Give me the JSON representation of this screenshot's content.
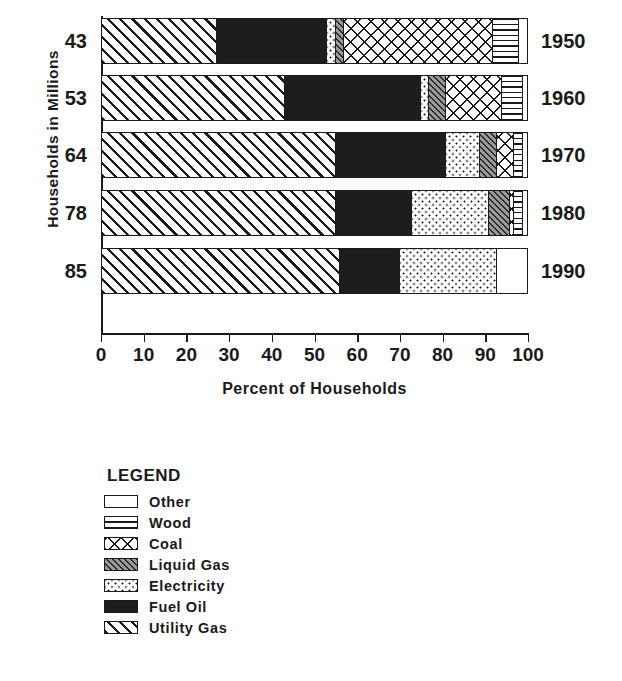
{
  "chart_data": {
    "type": "bar",
    "orientation": "horizontal",
    "stacked": true,
    "title": "",
    "xlabel": "Percent of Households",
    "ylabel": "Households  in  Millions",
    "xlim": [
      0,
      100
    ],
    "xticks": [
      0,
      10,
      20,
      30,
      40,
      50,
      60,
      70,
      80,
      90,
      100
    ],
    "xtick_labels": [
      "0",
      "10",
      "20",
      "30",
      "40",
      "50",
      "60",
      "70",
      "80",
      "90",
      "100"
    ],
    "grid": false,
    "legend_position": "below-left",
    "legend_title": "LEGEND",
    "categories": [
      "1950",
      "1960",
      "1970",
      "1980",
      "1990"
    ],
    "category_right_labels": [
      "1950",
      "1960",
      "1970",
      "1980",
      "1990"
    ],
    "category_left_labels": [
      "43",
      "53",
      "64",
      "78",
      "85"
    ],
    "series": [
      {
        "name": "Utility Gas",
        "pattern": "diagonal-hatch-right",
        "values": [
          27,
          43,
          55,
          55,
          56
        ]
      },
      {
        "name": "Fuel Oil",
        "pattern": "solid-black",
        "values": [
          26,
          32,
          26,
          18,
          14
        ]
      },
      {
        "name": "Electricity",
        "pattern": "fine-dots",
        "values": [
          2,
          2,
          8,
          18,
          23
        ]
      },
      {
        "name": "Liquid Gas",
        "pattern": "dense-gray-hatch",
        "values": [
          2,
          4,
          4,
          5,
          0
        ]
      },
      {
        "name": "Coal",
        "pattern": "cross-hatch",
        "values": [
          35,
          13,
          4,
          1,
          0
        ]
      },
      {
        "name": "Wood",
        "pattern": "horizontal-lines",
        "values": [
          6,
          5,
          2,
          2,
          0
        ]
      },
      {
        "name": "Other",
        "pattern": "empty-white",
        "values": [
          2,
          1,
          1,
          1,
          7
        ]
      }
    ],
    "legend_entries": [
      {
        "label": "Other",
        "pattern": "empty-white"
      },
      {
        "label": "Wood",
        "pattern": "horizontal-lines"
      },
      {
        "label": "Coal",
        "pattern": "cross-hatch"
      },
      {
        "label": "Liquid Gas",
        "pattern": "dense-gray-hatch"
      },
      {
        "label": "Electricity",
        "pattern": "fine-dots"
      },
      {
        "label": "Fuel Oil",
        "pattern": "solid-black"
      },
      {
        "label": "Utility Gas",
        "pattern": "diagonal-hatch-right"
      }
    ]
  },
  "colors": {
    "ink": "#1a1a1a",
    "background": "#ffffff",
    "fill_solid": "#1d1d1d",
    "fill_gray": "#9a9a9a"
  }
}
